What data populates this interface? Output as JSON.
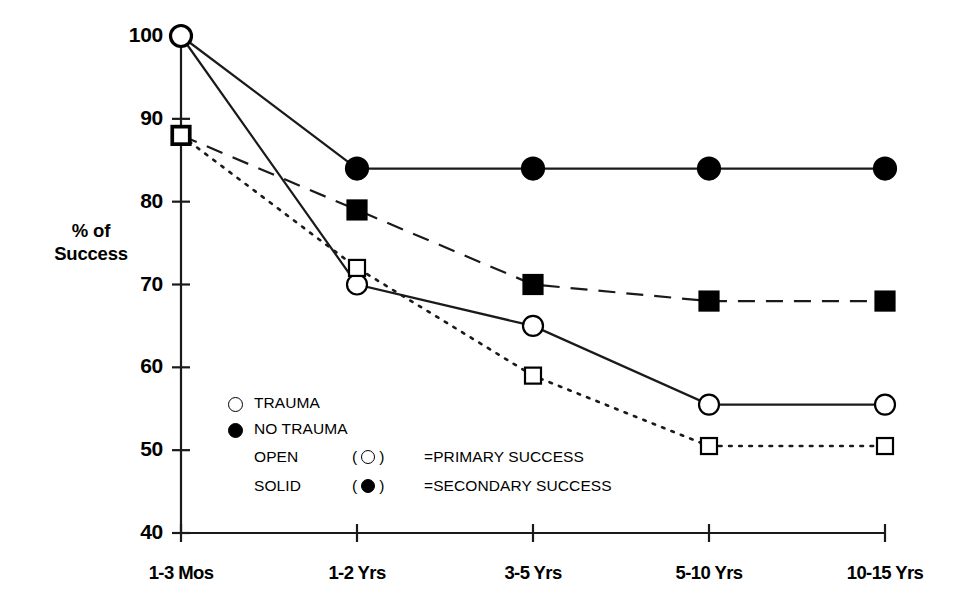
{
  "chart_data": {
    "type": "line",
    "title": "",
    "xlabel": "",
    "ylabel": "% of Success",
    "categories": [
      "1-3 Mos",
      "1-2 Yrs",
      "3-5 Yrs",
      "5-10 Yrs",
      "10-15 Yrs"
    ],
    "ylim": [
      40,
      100
    ],
    "yticks": [
      40,
      50,
      60,
      70,
      80,
      90,
      100
    ],
    "ytick_labels": [
      "40",
      "50",
      "60",
      "70",
      "80",
      "90",
      "100"
    ],
    "grid": false,
    "legend_position": "inside-lower-left",
    "series": [
      {
        "name": "NO TRAUMA - SECONDARY SUCCESS",
        "marker": "filled-circle",
        "line_style": "solid",
        "values": [
          100,
          84,
          84,
          84,
          84
        ]
      },
      {
        "name": "TRAUMA - PRIMARY SUCCESS",
        "marker": "open-circle",
        "line_style": "solid",
        "values": [
          100,
          70,
          65,
          55.5,
          55.5
        ]
      },
      {
        "name": "NO TRAUMA - SECONDARY SUCCESS (square)",
        "marker": "filled-square",
        "line_style": "dashed",
        "values": [
          88,
          79,
          70,
          68,
          68
        ]
      },
      {
        "name": "TRAUMA - PRIMARY SUCCESS (square)",
        "marker": "open-square",
        "line_style": "dotted",
        "values": [
          88,
          72,
          59,
          50.5,
          50.5
        ]
      }
    ]
  },
  "axis": {
    "y_title_line1": "% of",
    "y_title_line2": "Success"
  },
  "legend": {
    "rows": [
      {
        "marker": "open-circle",
        "label": "TRAUMA"
      },
      {
        "marker": "filled-circle",
        "label": "NO TRAUMA"
      }
    ],
    "definitions": [
      {
        "word": "OPEN",
        "open_paren": "(",
        "close_paren": ")",
        "marker": "open-circle",
        "equals": "=PRIMARY SUCCESS"
      },
      {
        "word": "SOLID",
        "open_paren": "(",
        "close_paren": ")",
        "marker": "filled-circle",
        "equals": "=SECONDARY SUCCESS"
      }
    ]
  },
  "colors": {
    "ink": "#000000",
    "background": "#ffffff"
  }
}
